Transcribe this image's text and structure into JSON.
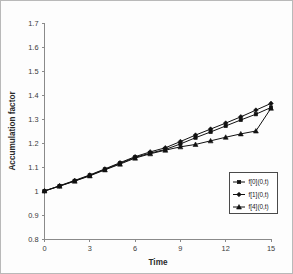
{
  "chart_data": {
    "type": "line",
    "title": "",
    "xlabel": "Time",
    "ylabel": "Accumulation factor",
    "xlim": [
      0,
      15
    ],
    "ylim": [
      0.8,
      1.7
    ],
    "xticks": [
      0,
      3,
      6,
      9,
      12,
      15
    ],
    "yticks": [
      0.8,
      0.9,
      1,
      1.1,
      1.2,
      1.3,
      1.4,
      1.5,
      1.6,
      1.7
    ],
    "xtick_labels": [
      "0",
      "3",
      "6",
      "9",
      "12",
      "15"
    ],
    "ytick_labels": [
      "0.8",
      "0.9",
      "1",
      "1.1",
      "1.2",
      "1.3",
      "1.4",
      "1.5",
      "1.6",
      "1.7"
    ],
    "grid": false,
    "legend_position": "lower-right",
    "x": [
      0,
      1,
      2,
      3,
      4,
      5,
      6,
      7,
      8,
      9,
      10,
      11,
      12,
      13,
      14,
      15
    ],
    "series": [
      {
        "name": "f[0](0,t)",
        "marker": "square",
        "values": [
          1.0,
          1.021,
          1.042,
          1.065,
          1.09,
          1.115,
          1.14,
          1.158,
          1.173,
          1.196,
          1.222,
          1.246,
          1.271,
          1.296,
          1.32,
          1.348
        ]
      },
      {
        "name": "f[1](0,t)",
        "marker": "diamond",
        "values": [
          1.0,
          1.022,
          1.044,
          1.067,
          1.092,
          1.118,
          1.143,
          1.163,
          1.18,
          1.206,
          1.233,
          1.258,
          1.283,
          1.309,
          1.337,
          1.365
        ]
      },
      {
        "name": "f[4](0,t)",
        "marker": "triangle",
        "values": [
          1.0,
          1.02,
          1.041,
          1.063,
          1.088,
          1.112,
          1.137,
          1.155,
          1.17,
          1.184,
          1.194,
          1.209,
          1.224,
          1.238,
          1.25,
          1.345
        ]
      }
    ]
  },
  "legend": {
    "entries": [
      {
        "label": "f[0](0,t)"
      },
      {
        "label": "f[1](0,t)"
      },
      {
        "label": "f[4](0,t)"
      }
    ]
  }
}
